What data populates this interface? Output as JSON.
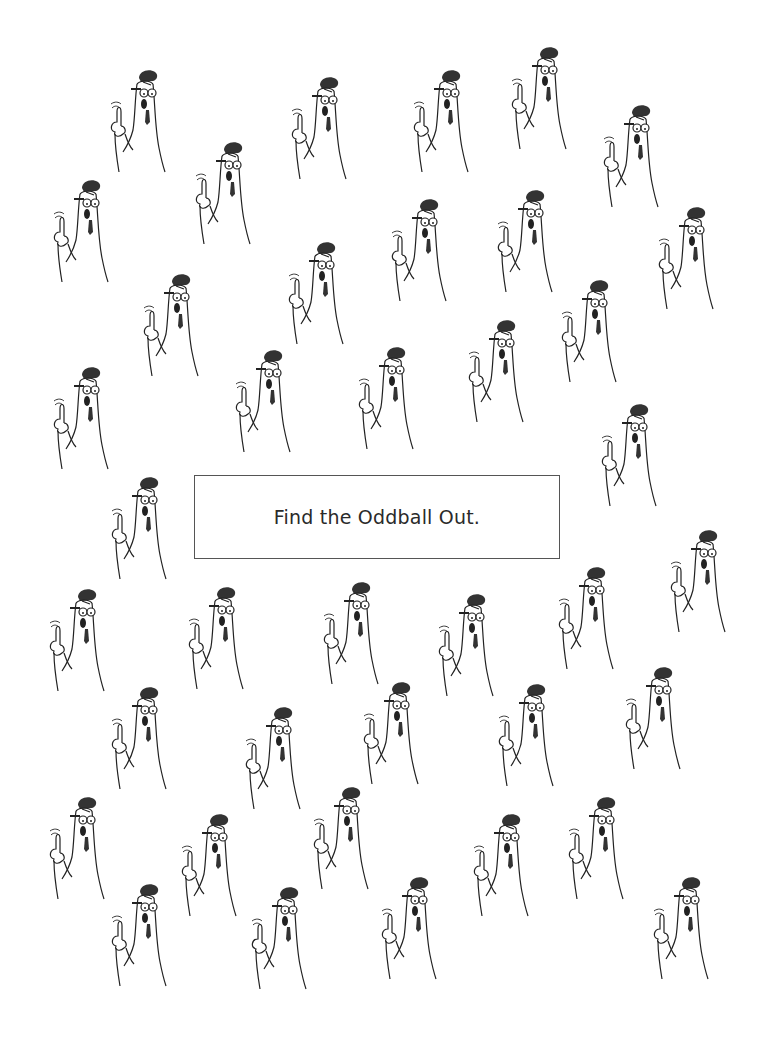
{
  "puzzle": {
    "prompt": "Find the Oddball Out.",
    "figure_description": "cartoon character with glasses, dark hat tuft, open mouth, necktie, raising index finger",
    "figure_count": 39
  },
  "colors": {
    "background": "#ffffff",
    "line": "#222222",
    "fill_dark": "#333333",
    "box_border": "#555555",
    "text": "#2a2a2a"
  }
}
